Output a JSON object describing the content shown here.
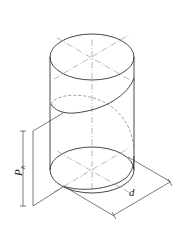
{
  "figure": {
    "labels": {
      "pitch_main": "P",
      "pitch_sub": "h",
      "diameter": "d"
    },
    "colors": {
      "line": "#333333",
      "center_line": "#888888",
      "hidden_line": "#777777",
      "background": "#ffffff"
    }
  }
}
